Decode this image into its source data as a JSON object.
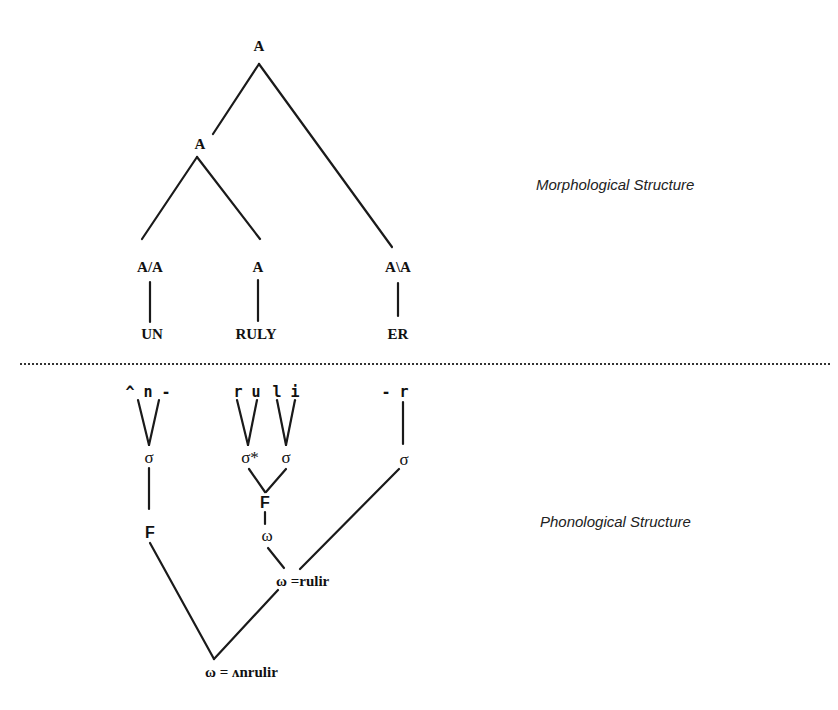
{
  "labels": {
    "morphological": "Morphological Structure",
    "phonological": "Phonological Structure"
  },
  "morphology": {
    "root": "A",
    "inner": "A",
    "prefix_cat": "A/A",
    "stem_cat": "A",
    "suffix_cat": "A\\A",
    "prefix": "UN",
    "stem": "RULY",
    "suffix": "ER"
  },
  "phonology": {
    "segments": {
      "un": "^ n -",
      "ru": "r u",
      "li": "l i",
      "er": "-  r"
    },
    "syllable": "σ",
    "stressed_syllable": "σ*",
    "foot": "F",
    "word": "ω",
    "inner_word_form": "ω =rulir",
    "outer_word_form": "ω = ʌnrulir"
  }
}
